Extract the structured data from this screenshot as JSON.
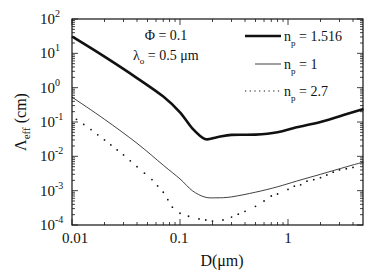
{
  "chart_data": {
    "type": "line",
    "title": "",
    "xlabel": "D(μm)",
    "ylabel": "Λ_eff (cm)",
    "xscale": "log",
    "yscale": "log",
    "xlim": [
      0.01,
      5
    ],
    "ylim": [
      0.0001,
      100
    ],
    "x_ticks": [
      "0.01",
      "0.1",
      "1"
    ],
    "y_ticks": [
      "10^2",
      "10^1",
      "10^0",
      "10^-1",
      "10^-2",
      "10^-3",
      "10^-4"
    ],
    "grid": false,
    "legend_position": "upper right",
    "annotations": [
      "Φ = 0.1",
      "λ_o = 0.5 μm"
    ],
    "series": [
      {
        "name": "n_p = 1.516",
        "style": "thick solid",
        "x": [
          0.01,
          0.02,
          0.04,
          0.07,
          0.1,
          0.13,
          0.17,
          0.22,
          0.3,
          0.5,
          0.8,
          1.2,
          2,
          3.5,
          5
        ],
        "y": [
          31,
          8,
          1.9,
          0.55,
          0.19,
          0.065,
          0.032,
          0.036,
          0.042,
          0.043,
          0.05,
          0.07,
          0.1,
          0.17,
          0.24
        ]
      },
      {
        "name": "n_p = 1",
        "style": "thin solid",
        "x": [
          0.01,
          0.02,
          0.04,
          0.07,
          0.1,
          0.13,
          0.17,
          0.22,
          0.3,
          0.5,
          0.8,
          1.2,
          2,
          3.5,
          5
        ],
        "y": [
          0.53,
          0.12,
          0.024,
          0.0055,
          0.0022,
          0.001,
          0.00065,
          0.00062,
          0.00066,
          0.0009,
          0.0013,
          0.0019,
          0.003,
          0.005,
          0.0068
        ]
      },
      {
        "name": "n_p = 2.7",
        "style": "dotted",
        "x": [
          0.011,
          0.015,
          0.02,
          0.03,
          0.04,
          0.055,
          0.07,
          0.085,
          0.1,
          0.12,
          0.15,
          0.2,
          0.25,
          0.3,
          0.4,
          0.5,
          0.6,
          0.7,
          0.8,
          1.0,
          1.5,
          2,
          3,
          4,
          5
        ],
        "y": [
          0.12,
          0.06,
          0.03,
          0.011,
          0.005,
          0.0021,
          0.0009,
          0.00033,
          0.00022,
          0.00018,
          0.00015,
          0.00013,
          0.00014,
          0.00017,
          0.00025,
          0.00035,
          0.0005,
          0.0007,
          0.0008,
          0.0011,
          0.0018,
          0.0025,
          0.0038,
          0.005,
          0.006
        ]
      }
    ]
  },
  "labels": {
    "phi": "Φ = 0.1",
    "lambda_main": "λ",
    "lambda_sub": "o",
    "lambda_rest": " = 0.5 μm",
    "xlabel": "D(μm)",
    "ylabel_main": "Λ",
    "ylabel_sub": "eff",
    "ylabel_unit": " (cm)",
    "legend": [
      {
        "main": "n",
        "sub": "p",
        "rest": " = 1.516"
      },
      {
        "main": "n",
        "sub": "p",
        "rest": " = 1"
      },
      {
        "main": "n",
        "sub": "p",
        "rest": " = 2.7"
      }
    ],
    "x_ticks": [
      "0.01",
      "0.1",
      "1"
    ],
    "y_ticks": [
      "2",
      "1",
      "0",
      "-1",
      "-2",
      "-3",
      "-4"
    ]
  }
}
